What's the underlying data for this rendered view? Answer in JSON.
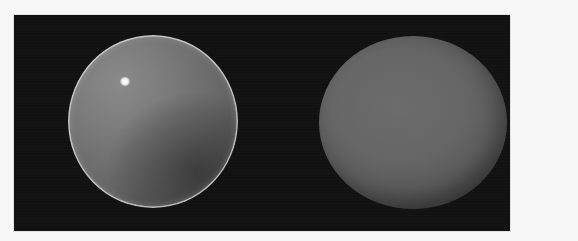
{
  "scene": {
    "description": "Two grey spheres rendered on a dark background",
    "background_color": "#121212",
    "page_color": "#f7f7f7",
    "objects": [
      {
        "name": "glossy-sphere",
        "material": "glossy",
        "has_specular_highlight": true,
        "base_color": "#747474",
        "rim_color": "#dcdcdc"
      },
      {
        "name": "matte-sphere",
        "material": "matte",
        "has_specular_highlight": false,
        "base_color": "#656565"
      }
    ]
  }
}
